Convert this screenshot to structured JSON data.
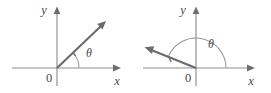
{
  "figure": {
    "caption": "",
    "background_color": "#ffffff",
    "axis_color": "#8d8d8d",
    "ray_color": "#6b6b6b",
    "arc_color": "#9a9a9a",
    "label_color": "#4a4a4a"
  },
  "panels": [
    {
      "id": "left",
      "name": "positive-angle-standard-position",
      "description": "Acute angle theta in standard position with terminal ray in the first quadrant",
      "labels": {
        "y_axis": "y",
        "x_axis": "x",
        "origin": "0",
        "angle": "θ"
      },
      "geometry": {
        "origin": [
          57,
          68
        ],
        "x_axis": [
          12,
          68,
          118,
          68
        ],
        "y_axis": [
          57,
          10,
          57,
          86
        ],
        "ray_end": [
          104,
          22
        ],
        "ray_angle_deg": 44,
        "arc_radius": 22,
        "arc_from_deg": 0,
        "arc_to_deg": 44,
        "rotation": "counterclockwise"
      }
    },
    {
      "id": "right",
      "name": "obtuse-angle-standard-position",
      "description": "Obtuse angle theta in standard position with terminal ray in the second quadrant",
      "labels": {
        "y_axis": "y",
        "x_axis": "x",
        "origin": "0",
        "angle": "θ"
      },
      "geometry": {
        "origin": [
          61,
          68
        ],
        "x_axis": [
          8,
          68,
          120,
          68
        ],
        "y_axis": [
          61,
          10,
          61,
          86
        ],
        "ray_end": [
          10,
          47
        ],
        "ray_angle_deg": 157,
        "arc_radius": 30,
        "arc_from_deg": 0,
        "arc_to_deg": 157,
        "rotation": "counterclockwise"
      }
    }
  ]
}
